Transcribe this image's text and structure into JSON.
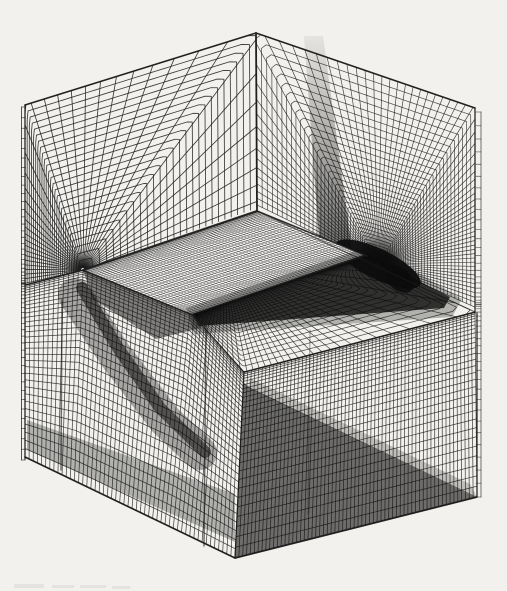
{
  "scene": {
    "width": 507,
    "height": 591,
    "background": "#f2f1ed",
    "line_color": "#1c1c1c",
    "dark_color": "#0c0c0c",
    "smudge_color": "#8a8a85",
    "description": "Scanned wireframe figure of a 3D computational grid around a swept wing, drawn as a cut-open box: symmetry-plane fan grid upper-left, C-grid around wing-tip section upper-right, wing planform surface mesh in the middle, dense volume-grid faces on the lower block",
    "render_order": [
      "face:leftWall",
      "face:rightWall",
      "overlay:rightBand",
      "overlay:blob",
      "overlay:blob2",
      "face:plane",
      "face:wing",
      "overlay:underLE",
      "overlay:teSoft",
      "overlay:teCore",
      "face:frontLeft",
      "face:frontRight",
      "overlay:flStreakWide",
      "overlay:flStreakCore",
      "overlay:flBottomBand",
      "overlay:frTrianglePre",
      "overlay:frTriangle",
      "edges",
      "strips",
      "smudges"
    ],
    "faces": {
      "leftWall": {
        "type": "polar",
        "center": [
          83,
          270
        ],
        "r0": 2.5,
        "a0": -17,
        "a1": -193,
        "rays": 40,
        "rings": 26,
        "ringCluster": {
          "two": [
            2.0,
            2.2,
            0.5
          ]
        },
        "boundary": [
          [
            25,
            105
          ],
          [
            256,
            33
          ],
          [
            257,
            211
          ],
          [
            83,
            270
          ],
          [
            25,
            285
          ]
        ],
        "width": 0.85,
        "alpha": 0.85
      },
      "rightWall": {
        "type": "polar",
        "center": [
          378,
          264
        ],
        "r0": 3,
        "a0": 24,
        "a1": -154,
        "rays": 72,
        "rings": 40,
        "ringCluster": {
          "pow": 1.8
        },
        "boundary": [
          [
            256,
            33
          ],
          [
            475,
            108
          ],
          [
            475,
            312
          ],
          [
            257,
            211
          ]
        ],
        "width": 0.7,
        "alpha": 0.8
      },
      "plane": {
        "type": "ring",
        "center": [
          225,
          263
        ],
        "inner": [
          [
            83,
            270
          ],
          [
            257,
            211
          ],
          [
            367,
            256
          ],
          [
            193,
            315
          ]
        ],
        "outer": [
          [
            83,
            270
          ],
          [
            257,
            211
          ],
          [
            475,
            312
          ],
          [
            244,
            372
          ],
          [
            193,
            315
          ]
        ],
        "rays": 110,
        "rings": 24,
        "ringCluster": {
          "pow": 2.0
        },
        "width": 0.7,
        "alpha": 0.8
      },
      "wing": {
        "type": "coons",
        "top": [
          [
            83,
            270
          ],
          [
            257,
            211
          ]
        ],
        "bottom": [
          [
            193,
            315
          ],
          [
            367,
            256
          ]
        ],
        "left": [
          [
            83,
            270
          ],
          [
            193,
            315
          ]
        ],
        "right": [
          [
            257,
            211
          ],
          [
            367,
            256
          ]
        ],
        "uLines": 55,
        "vLines": 48,
        "uCluster": {
          "uniform": true
        },
        "vCluster": {
          "cos": true
        },
        "fill": "#f3f2f0",
        "width": 0.5,
        "alpha": 0.75
      },
      "frontLeft": {
        "type": "coons",
        "top": [
          [
            25,
            285
          ],
          [
            83,
            270
          ],
          [
            193,
            315
          ],
          [
            244,
            372
          ]
        ],
        "bottom": [
          [
            25,
            457
          ],
          [
            235,
            558
          ]
        ],
        "left": [
          [
            25,
            285
          ],
          [
            25,
            457
          ]
        ],
        "right": [
          [
            244,
            372
          ],
          [
            235,
            558
          ]
        ],
        "uLines": 52,
        "vLines": 34,
        "uCluster": {
          "uniform": true
        },
        "vCluster": {
          "pow": 1.65
        },
        "width": 0.75,
        "alpha": 0.8
      },
      "frontRight": {
        "type": "coons",
        "top": [
          [
            244,
            372
          ],
          [
            475,
            312
          ]
        ],
        "bottom": [
          [
            235,
            558
          ],
          [
            477,
            497
          ]
        ],
        "left": [
          [
            244,
            372
          ],
          [
            235,
            558
          ]
        ],
        "right": [
          [
            475,
            312
          ],
          [
            477,
            497
          ]
        ],
        "uLines": 64,
        "vLines": 30,
        "uCluster": {
          "uniform": true
        },
        "vCluster": {
          "pow": 1.7
        },
        "width": 0.75,
        "alpha": 0.8
      }
    },
    "overlays": {
      "rightBand": {
        "type": "gradquad",
        "pts": [
          [
            304,
            36
          ],
          [
            323,
            36
          ],
          [
            352,
            250
          ],
          [
            320,
            252
          ]
        ],
        "g0": [
          313,
          36
        ],
        "g1": [
          336,
          250
        ],
        "a0": 0.06,
        "a1": 0.55
      },
      "blob": {
        "type": "ellipse",
        "c": [
          378,
          264
        ],
        "rx": 47,
        "ry": 15,
        "rot": 26,
        "alpha": 0.92
      },
      "blob2": {
        "type": "ellipse",
        "c": [
          399,
          279
        ],
        "rx": 17,
        "ry": 11,
        "rot": 40,
        "alpha": 0.85
      },
      "underLE": {
        "type": "polygon",
        "pts": [
          [
            83,
            270
          ],
          [
            193,
            315
          ],
          [
            201,
            328
          ],
          [
            156,
            339
          ],
          [
            93,
            299
          ]
        ],
        "alpha": 0.5
      },
      "teSoft": {
        "type": "polygon",
        "pts": [
          [
            186,
            308
          ],
          [
            367,
            247
          ],
          [
            393,
            258
          ],
          [
            462,
            299
          ],
          [
            452,
            317
          ],
          [
            194,
            334
          ]
        ],
        "alpha": 0.28
      },
      "teCore": {
        "type": "polygon",
        "pts": [
          [
            192,
            314
          ],
          [
            366,
            254
          ],
          [
            382,
            262
          ],
          [
            450,
            297
          ],
          [
            444,
            308
          ],
          [
            199,
            326
          ]
        ],
        "alpha": 0.78
      },
      "flStreakWide": {
        "type": "path",
        "pts": [
          [
            75,
            295
          ],
          [
            115,
            355
          ],
          [
            165,
            420
          ],
          [
            200,
            453
          ]
        ],
        "lw": 34,
        "alpha": 0.33
      },
      "flStreakCore": {
        "type": "path",
        "pts": [
          [
            82,
            288
          ],
          [
            118,
            348
          ],
          [
            160,
            408
          ],
          [
            205,
            452
          ]
        ],
        "lw": 12,
        "alpha": 0.55
      },
      "flBottomBand": {
        "type": "polygon",
        "pts": [
          [
            27,
            420
          ],
          [
            235,
            494
          ],
          [
            235,
            542
          ],
          [
            27,
            450
          ]
        ],
        "alpha": 0.28
      },
      "frTrianglePre": {
        "type": "polygon",
        "pts": [
          [
            250,
            378
          ],
          [
            470,
            484
          ],
          [
            477,
            497
          ],
          [
            248,
            388
          ]
        ],
        "alpha": 0.22
      },
      "frTriangle": {
        "type": "polygon",
        "pts": [
          [
            249,
            387
          ],
          [
            477,
            497
          ],
          [
            235,
            558
          ],
          [
            243,
            382
          ]
        ],
        "alpha": 0.58
      }
    },
    "edges": [
      {
        "pts": [
          [
            25,
            105
          ],
          [
            256,
            33
          ]
        ],
        "w": 1.6,
        "a": 0.95
      },
      {
        "pts": [
          [
            256,
            33
          ],
          [
            475,
            108
          ]
        ],
        "w": 1.6,
        "a": 0.95
      },
      {
        "pts": [
          [
            256,
            33
          ],
          [
            257,
            211
          ]
        ],
        "w": 1.8,
        "a": 0.95
      },
      {
        "pts": [
          [
            25,
            105
          ],
          [
            25,
            459
          ]
        ],
        "w": 1.3,
        "a": 0.9
      },
      {
        "pts": [
          [
            475,
            108
          ],
          [
            475,
            313
          ]
        ],
        "w": 1.3,
        "a": 0.9
      },
      {
        "pts": [
          [
            477,
            313
          ],
          [
            477,
            497
          ]
        ],
        "w": 1.3,
        "a": 0.9
      },
      {
        "pts": [
          [
            25,
            285
          ],
          [
            83,
            270
          ]
        ],
        "w": 1.4,
        "a": 0.9
      },
      {
        "pts": [
          [
            83,
            270
          ],
          [
            193,
            315
          ]
        ],
        "w": 1.4,
        "a": 0.85
      },
      {
        "pts": [
          [
            193,
            315
          ],
          [
            244,
            372
          ]
        ],
        "w": 1.0,
        "a": 0.5
      },
      {
        "pts": [
          [
            244,
            372
          ],
          [
            475,
            312
          ]
        ],
        "w": 1.4,
        "a": 0.9
      },
      {
        "pts": [
          [
            244,
            372
          ],
          [
            235,
            558
          ]
        ],
        "w": 1.3,
        "a": 0.85
      },
      {
        "pts": [
          [
            25,
            457
          ],
          [
            235,
            558
          ]
        ],
        "w": 1.7,
        "a": 0.95
      },
      {
        "pts": [
          [
            235,
            558
          ],
          [
            477,
            497
          ]
        ],
        "w": 1.7,
        "a": 0.95
      },
      {
        "pts": [
          [
            257,
            211
          ],
          [
            475,
            312
          ]
        ],
        "w": 1.1,
        "a": 0.65
      },
      {
        "pts": [
          [
            83,
            270
          ],
          [
            257,
            211
          ]
        ],
        "w": 2.0,
        "a": 0.9
      },
      {
        "pts": [
          [
            257,
            211
          ],
          [
            367,
            256
          ]
        ],
        "w": 1.5,
        "a": 0.85
      },
      {
        "pts": [
          [
            206,
            318
          ],
          [
            204,
            546
          ]
        ],
        "w": 1.4,
        "a": 0.65
      },
      {
        "pts": [
          [
            62,
            300
          ],
          [
            61,
            470
          ]
        ],
        "w": 1.5,
        "a": 0.6
      },
      {
        "pts": [
          [
            310,
            330
          ],
          [
            308,
            514
          ]
        ],
        "w": 1.1,
        "a": 0.4
      }
    ],
    "strips": [
      {
        "rail": [
          [
            21.5,
            107
          ],
          [
            21.5,
            460
          ]
        ],
        "dx": 4,
        "count": 56,
        "cluster": {
          "center": 1.7
        },
        "lw": 0.8,
        "alpha": 0.75
      },
      {
        "rail": [
          [
            481,
            112
          ],
          [
            481,
            497
          ]
        ],
        "dx": -5,
        "count": 48,
        "cluster": {
          "center": 1.7
        },
        "lw": 0.8,
        "alpha": 0.6
      }
    ],
    "smudges": {
      "alpha": 0.13,
      "rects": [
        [
          14,
          584,
          30,
          4
        ],
        [
          52,
          585,
          22,
          3
        ],
        [
          80,
          585,
          26,
          3
        ],
        [
          112,
          586,
          18,
          3
        ]
      ]
    }
  }
}
